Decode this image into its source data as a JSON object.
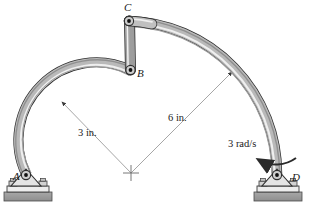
{
  "figure": {
    "background_color": "#ffffff",
    "line_color": "#1a1a1a",
    "link_fill_color": "#b5b5b5",
    "link_highlight_color": "#ededed",
    "ground_fill_color": "#9a9a9a",
    "dimension_line_color": "#6e6e6e"
  },
  "joints": [
    {
      "id": "A",
      "label": "A",
      "x": 26,
      "y": 177,
      "type": "pinned-support"
    },
    {
      "id": "B",
      "label": "B",
      "x": 130,
      "y": 70,
      "type": "pin-joint"
    },
    {
      "id": "C",
      "label": "C",
      "x": 129,
      "y": 21,
      "type": "pin-joint"
    },
    {
      "id": "D",
      "label": "D",
      "x": 277,
      "y": 177,
      "type": "pinned-support"
    }
  ],
  "center_mark": {
    "x": 131,
    "y": 173,
    "label": ""
  },
  "dimensions": [
    {
      "id": "radius-small",
      "label": "3 in.",
      "value": 3,
      "unit": "in.",
      "from": {
        "x": 131,
        "y": 173
      },
      "to": {
        "x": 60,
        "y": 100
      },
      "applies_to": "arc-AB"
    },
    {
      "id": "radius-large",
      "label": "6 in.",
      "value": 6,
      "unit": "in.",
      "from": {
        "x": 131,
        "y": 173
      },
      "to": {
        "x": 234,
        "y": 70
      },
      "applies_to": "arc-CD"
    }
  ],
  "annotations": [
    {
      "id": "angular-velocity",
      "label": "3 rad/s",
      "value": 3,
      "unit": "rad/s",
      "sense": "counterclockwise",
      "at_joint": "D"
    }
  ],
  "members": [
    {
      "id": "arc-AB",
      "type": "curved-link",
      "from": "A",
      "to": "B",
      "radius_in": 3
    },
    {
      "id": "link-BC",
      "type": "straight-link",
      "from": "B",
      "to": "C"
    },
    {
      "id": "arc-CD",
      "type": "curved-link",
      "from": "C",
      "to": "D",
      "radius_in": 6
    }
  ]
}
